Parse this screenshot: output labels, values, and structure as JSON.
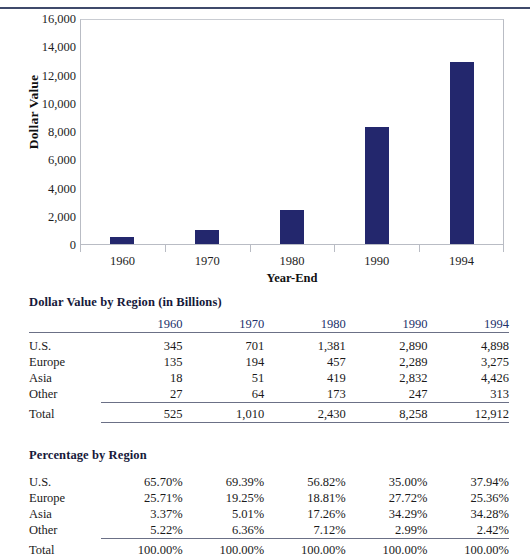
{
  "chart_data": {
    "type": "bar",
    "title": "",
    "xlabel": "Year-End",
    "ylabel": "Dollar Value",
    "categories": [
      "1960",
      "1970",
      "1980",
      "1990",
      "1994"
    ],
    "values": [
      525,
      1010,
      2430,
      8258,
      12912
    ],
    "ylim": [
      0,
      16000
    ],
    "yticks": [
      0,
      2000,
      4000,
      6000,
      8000,
      10000,
      12000,
      14000,
      16000
    ],
    "ytick_labels": [
      "0",
      "2,000",
      "4,000",
      "6,000",
      "8,000",
      "10,000",
      "12,000",
      "14,000",
      "16,000"
    ],
    "grid": false,
    "legend": false,
    "bar_color": "#23276d"
  },
  "colors": {
    "bar": "#23276d",
    "header_text": "#21306b",
    "rule": "#6b7086",
    "top_rule": "#3f4a6b",
    "plot_border": "#b9bcc4"
  },
  "dollar_table": {
    "caption": "Dollar Value by Region (in Billions)",
    "corner_header": "",
    "columns": [
      "1960",
      "1970",
      "1980",
      "1990",
      "1994"
    ],
    "rows": [
      {
        "label": "U.S.",
        "values": [
          "345",
          "701",
          "1,381",
          "2,890",
          "4,898"
        ]
      },
      {
        "label": "Europe",
        "values": [
          "135",
          "194",
          "457",
          "2,289",
          "3,275"
        ]
      },
      {
        "label": "Asia",
        "values": [
          "18",
          "51",
          "419",
          "2,832",
          "4,426"
        ]
      },
      {
        "label": "Other",
        "values": [
          "27",
          "64",
          "173",
          "247",
          "313"
        ]
      }
    ],
    "total": {
      "label": "Total",
      "values": [
        "525",
        "1,010",
        "2,430",
        "8,258",
        "12,912"
      ]
    }
  },
  "pct_table": {
    "caption": "Percentage by Region",
    "corner_header": "",
    "rows": [
      {
        "label": "U.S.",
        "values": [
          "65.70%",
          "69.39%",
          "56.82%",
          "35.00%",
          "37.94%"
        ]
      },
      {
        "label": "Europe",
        "values": [
          "25.71%",
          "19.25%",
          "18.81%",
          "27.72%",
          "25.36%"
        ]
      },
      {
        "label": "Asia",
        "values": [
          "3.37%",
          "5.01%",
          "17.26%",
          "34.29%",
          "34.28%"
        ]
      },
      {
        "label": "Other",
        "values": [
          "5.22%",
          "6.36%",
          "7.12%",
          "2.99%",
          "2.42%"
        ]
      }
    ],
    "total": {
      "label": "Total",
      "values": [
        "100.00%",
        "100.00%",
        "100.00%",
        "100.00%",
        "100.00%"
      ]
    }
  }
}
